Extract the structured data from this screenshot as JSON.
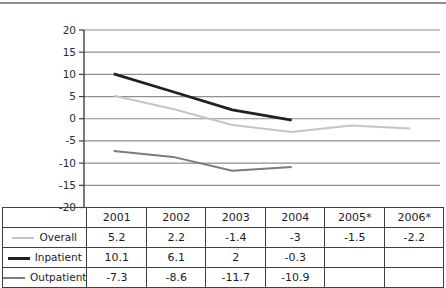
{
  "chart_data": {
    "type": "line",
    "title": "",
    "categories": [
      "2001",
      "2002",
      "2003",
      "2004",
      "2005*",
      "2006*"
    ],
    "series": [
      {
        "name": "Overall",
        "color": "#c5c5c5",
        "stroke_width": 2,
        "values": [
          5.2,
          2.2,
          -1.4,
          -3,
          -1.5,
          -2.2
        ]
      },
      {
        "name": "Inpatient",
        "color": "#212121",
        "stroke_width": 2.7,
        "values": [
          10.1,
          6.1,
          2,
          -0.3,
          null,
          null
        ]
      },
      {
        "name": "Outpatient",
        "color": "#7c7c7c",
        "stroke_width": 2,
        "values": [
          -7.3,
          -8.6,
          -11.7,
          -10.9,
          null,
          null
        ]
      }
    ],
    "xlabel": "",
    "ylabel": "",
    "ylim": [
      -20,
      20
    ],
    "yticks": [
      20,
      15,
      10,
      5,
      0,
      -5,
      -10,
      -15,
      -20
    ],
    "grid": true,
    "legend_position": "table-left-column",
    "colors": {
      "grid": "#8f8f8f",
      "axis": "#3f3f3f",
      "tick_text": "#2a2a2a",
      "table_border": "#3f3f3f",
      "top_rule": "#8e8e8e"
    }
  }
}
